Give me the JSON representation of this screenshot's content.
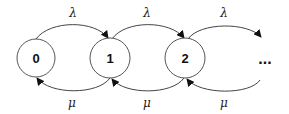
{
  "diagram": {
    "type": "birth-death chain",
    "nodes": [
      {
        "id": "0",
        "label": "0"
      },
      {
        "id": "1",
        "label": "1"
      },
      {
        "id": "2",
        "label": "2"
      }
    ],
    "continuation": "...",
    "edges": [
      {
        "from": "0",
        "to": "1",
        "label": "λ",
        "direction": "forward"
      },
      {
        "from": "1",
        "to": "2",
        "label": "λ",
        "direction": "forward"
      },
      {
        "from": "2",
        "to": "...",
        "label": "λ",
        "direction": "forward"
      },
      {
        "from": "1",
        "to": "0",
        "label": "μ",
        "direction": "backward"
      },
      {
        "from": "2",
        "to": "1",
        "label": "μ",
        "direction": "backward"
      },
      {
        "from": "...",
        "to": "2",
        "label": "μ",
        "direction": "backward"
      }
    ]
  }
}
